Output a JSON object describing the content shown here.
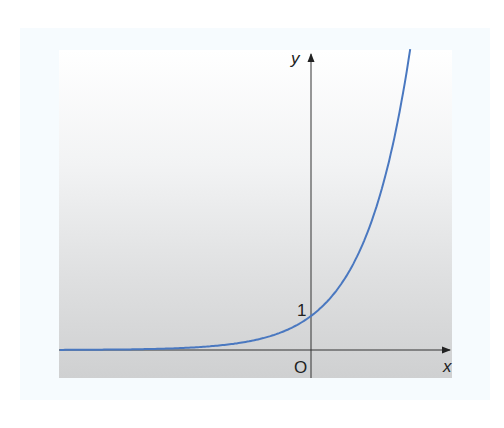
{
  "chart_data": {
    "type": "line",
    "title": "",
    "function": "y = e^x",
    "xlabel": "x",
    "ylabel": "y",
    "tick_labels": {
      "y_one": "1",
      "origin": "O"
    },
    "xlim": [
      -5.6,
      3.1
    ],
    "ylim": [
      -0.8,
      8.8
    ],
    "grid": false,
    "legend": null,
    "series": [
      {
        "name": "exponential curve",
        "color": "#4a78c0",
        "x": [
          -5.5,
          -4,
          -3,
          -2,
          -1,
          -0.5,
          0,
          0.5,
          1,
          1.5,
          2,
          2.18
        ],
        "y": [
          0.004,
          0.018,
          0.05,
          0.135,
          0.368,
          0.607,
          1,
          1.649,
          2.718,
          4.482,
          7.389,
          8.85
        ]
      }
    ],
    "annotations": [
      {
        "text": "1",
        "at": "y-intercept"
      },
      {
        "text": "O",
        "at": "origin"
      }
    ]
  },
  "labels": {
    "y_axis": "y",
    "x_axis": "x",
    "one": "1",
    "origin": "O"
  },
  "colors": {
    "curve": "#4a78c0",
    "axis": "#222222"
  }
}
